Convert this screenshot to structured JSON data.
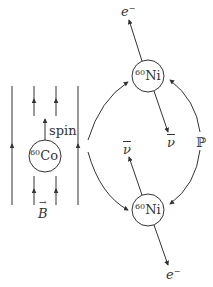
{
  "diagram": {
    "title": "",
    "cobalt": {
      "mass": "60",
      "symbol": "Co",
      "spin_label": "spin",
      "field_label": "B"
    },
    "nickel_top": {
      "mass": "60",
      "symbol": "Ni",
      "electron_label": "e",
      "electron_charge": "−",
      "antineutrino_label": "ν"
    },
    "nickel_bottom": {
      "mass": "60",
      "symbol": "Ni",
      "electron_label": "e",
      "electron_charge": "−",
      "antineutrino_label": "ν"
    },
    "parity_label": "ℙ",
    "colors": {
      "line": "#333333",
      "background": "#ffffff"
    }
  }
}
